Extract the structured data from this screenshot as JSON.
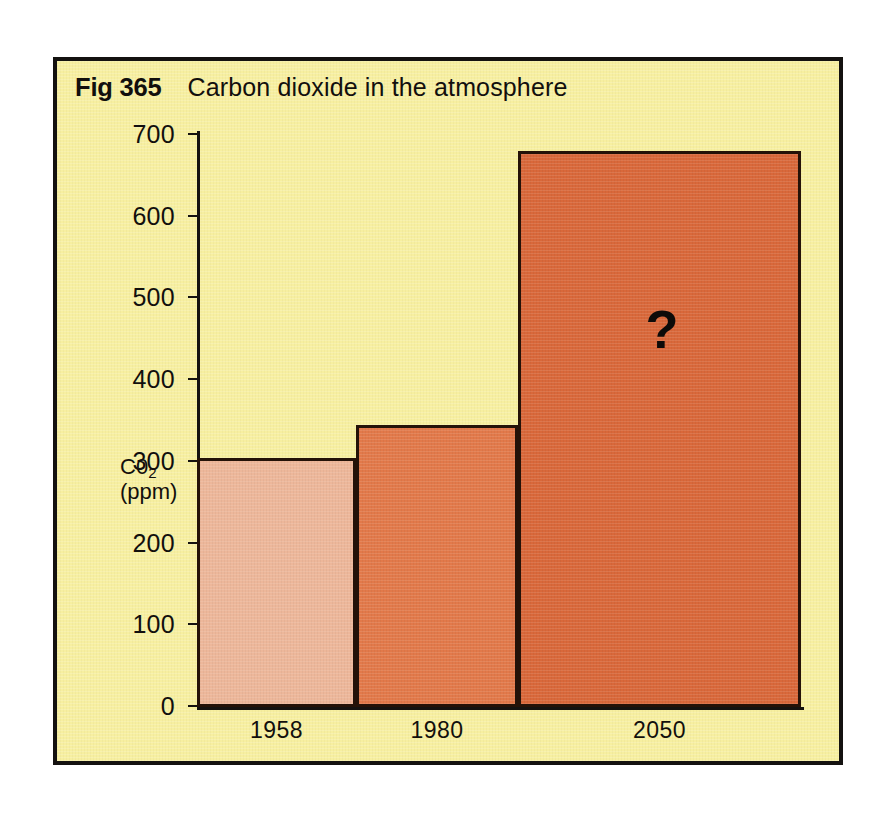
{
  "figure": {
    "number": "Fig 365",
    "title": "Carbon dioxide in the atmosphere",
    "panel_background": "#f7efa0",
    "frame_color": "#141210"
  },
  "chart_data": {
    "type": "bar",
    "title": "Carbon dioxide in the atmosphere",
    "xlabel": "",
    "ylabel": "C0₂ (ppm)",
    "ylabel_lines": [
      "C0",
      "2",
      "(ppm)"
    ],
    "categories": [
      "1958",
      "1980",
      "2050"
    ],
    "values": [
      305,
      345,
      680
    ],
    "ylim": [
      0,
      700
    ],
    "yticks": [
      0,
      100,
      200,
      300,
      400,
      500,
      600,
      700
    ],
    "ytick_labels": [
      "0",
      "100",
      "200",
      "300",
      "400",
      "500",
      "600",
      "700"
    ],
    "grid": false,
    "legend": false,
    "annotations": [
      {
        "text": "?",
        "category": "2050",
        "value": 430
      }
    ],
    "bar_colors": [
      "#edb79a",
      "#e2794a",
      "#d9683a"
    ],
    "bar_edge_color": "#241208",
    "series": [
      {
        "name": "CO2 concentration (ppm)",
        "values": [
          305,
          345,
          680
        ]
      }
    ]
  },
  "axis": {
    "tick_0": "0",
    "tick_100": "100",
    "tick_200": "200",
    "tick_300": "300",
    "tick_400": "400",
    "tick_500": "500",
    "tick_600": "600",
    "tick_700": "700"
  },
  "marker": {
    "question": "?"
  }
}
